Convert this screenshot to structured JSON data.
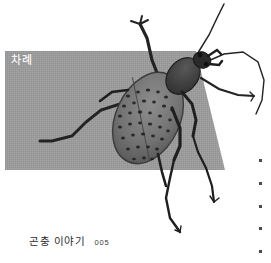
{
  "page": {
    "width": 271,
    "height": 263,
    "background_color": "#ffffff"
  },
  "band": {
    "name": "gray-panel",
    "fill_color": "#9b9b9b",
    "shape": "parallelogram",
    "points": "5,51 196,51 225,170 5,170"
  },
  "section": {
    "label": "차례",
    "label_color": "#f2f2f2"
  },
  "photo": {
    "subject": "insect-photo",
    "alt_name": "beetle-photograph",
    "body_color": "#6f6f6f",
    "limb_color": "#2b2b2b",
    "spot_color": "#1c1c1c"
  },
  "caption": {
    "title": "곤충 이야기",
    "page_number": "005",
    "title_color": "#2b2b2b"
  },
  "dots": {
    "count": 5,
    "color": "#4a4a4a",
    "items": [
      "dot-1",
      "dot-2",
      "dot-3",
      "dot-4",
      "dot-5"
    ]
  }
}
